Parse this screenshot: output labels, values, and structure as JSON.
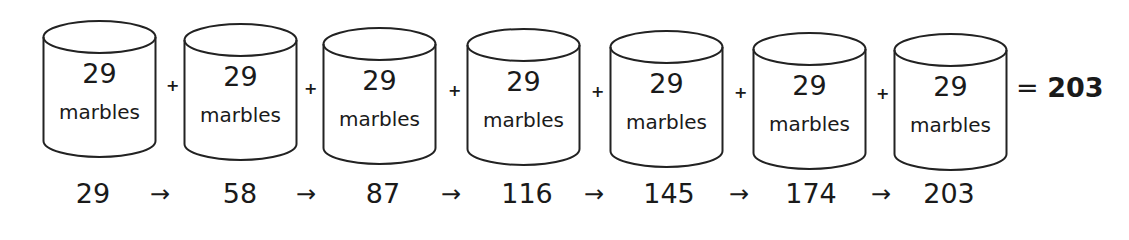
{
  "diagram": {
    "containers": [
      {
        "count": "29",
        "unit": "marbles"
      },
      {
        "count": "29",
        "unit": "marbles"
      },
      {
        "count": "29",
        "unit": "marbles"
      },
      {
        "count": "29",
        "unit": "marbles"
      },
      {
        "count": "29",
        "unit": "marbles"
      },
      {
        "count": "29",
        "unit": "marbles"
      },
      {
        "count": "29",
        "unit": "marbles"
      }
    ],
    "operator": "+",
    "equals": "=",
    "total": "203",
    "arrow": "→",
    "running_totals": [
      "29",
      "58",
      "87",
      "116",
      "145",
      "174",
      "203"
    ]
  }
}
